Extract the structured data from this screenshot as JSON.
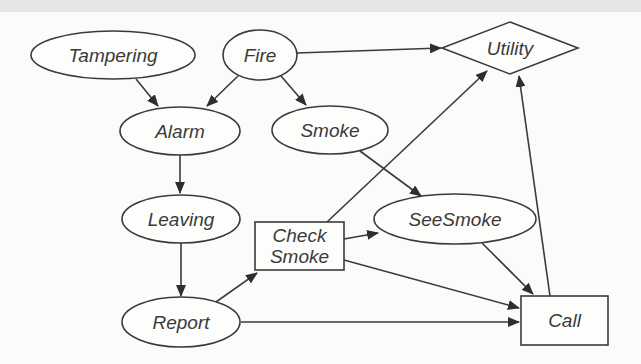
{
  "diagram": {
    "type": "decision-network",
    "nodes": [
      {
        "id": "tampering",
        "label": "Tampering",
        "kind": "chance",
        "shape": "ellipse",
        "cx": 113,
        "cy": 55,
        "rx": 82,
        "ry": 24
      },
      {
        "id": "fire",
        "label": "Fire",
        "kind": "chance",
        "shape": "ellipse",
        "cx": 260,
        "cy": 55,
        "rx": 37,
        "ry": 25
      },
      {
        "id": "utility",
        "label": "Utility",
        "kind": "utility",
        "shape": "diamond",
        "cx": 510,
        "cy": 48,
        "hw": 68,
        "hh": 26
      },
      {
        "id": "alarm",
        "label": "Alarm",
        "kind": "chance",
        "shape": "ellipse",
        "cx": 180,
        "cy": 131,
        "rx": 60,
        "ry": 24
      },
      {
        "id": "smoke",
        "label": "Smoke",
        "kind": "chance",
        "shape": "ellipse",
        "cx": 330,
        "cy": 130,
        "rx": 58,
        "ry": 24
      },
      {
        "id": "leaving",
        "label": "Leaving",
        "kind": "chance",
        "shape": "ellipse",
        "cx": 181,
        "cy": 219,
        "rx": 59,
        "ry": 24
      },
      {
        "id": "check_smoke",
        "label_lines": [
          "Check",
          "Smoke"
        ],
        "kind": "decision",
        "shape": "rect",
        "x": 255,
        "y": 222,
        "w": 89,
        "h": 48
      },
      {
        "id": "see_smoke",
        "label": "SeeSmoke",
        "kind": "chance",
        "shape": "ellipse",
        "cx": 455,
        "cy": 219,
        "rx": 81,
        "ry": 25
      },
      {
        "id": "report",
        "label": "Report",
        "kind": "chance",
        "shape": "ellipse",
        "cx": 181,
        "cy": 322,
        "rx": 59,
        "ry": 25
      },
      {
        "id": "call",
        "label": "Call",
        "kind": "decision",
        "shape": "rect",
        "x": 521,
        "y": 296,
        "w": 87,
        "h": 49
      }
    ],
    "edges": [
      {
        "from": "tampering",
        "to": "alarm",
        "x1": 136,
        "y1": 79,
        "x2": 158,
        "y2": 106
      },
      {
        "from": "fire",
        "to": "alarm",
        "x1": 238,
        "y1": 76,
        "x2": 207,
        "y2": 106
      },
      {
        "from": "fire",
        "to": "smoke",
        "x1": 281,
        "y1": 76,
        "x2": 306,
        "y2": 105
      },
      {
        "from": "fire",
        "to": "utility",
        "x1": 297,
        "y1": 53,
        "x2": 441,
        "y2": 48
      },
      {
        "from": "alarm",
        "to": "leaving",
        "x1": 180,
        "y1": 155,
        "x2": 180,
        "y2": 193
      },
      {
        "from": "smoke",
        "to": "see_smoke",
        "x1": 360,
        "y1": 151,
        "x2": 421,
        "y2": 196
      },
      {
        "from": "leaving",
        "to": "report",
        "x1": 181,
        "y1": 243,
        "x2": 181,
        "y2": 296
      },
      {
        "from": "report",
        "to": "check_smoke",
        "x1": 216,
        "y1": 302,
        "x2": 257,
        "y2": 273
      },
      {
        "from": "check_smoke",
        "to": "utility",
        "x1": 327,
        "y1": 222,
        "x2": 487,
        "y2": 71
      },
      {
        "from": "check_smoke",
        "to": "see_smoke",
        "x1": 344,
        "y1": 239,
        "x2": 378,
        "y2": 233
      },
      {
        "from": "check_smoke",
        "to": "call",
        "x1": 344,
        "y1": 260,
        "x2": 519,
        "y2": 308
      },
      {
        "from": "see_smoke",
        "to": "call",
        "x1": 482,
        "y1": 243,
        "x2": 533,
        "y2": 294
      },
      {
        "from": "report",
        "to": "call",
        "x1": 241,
        "y1": 322,
        "x2": 519,
        "y2": 322
      },
      {
        "from": "call",
        "to": "utility",
        "x1": 550,
        "y1": 296,
        "x2": 519,
        "y2": 76
      }
    ]
  }
}
